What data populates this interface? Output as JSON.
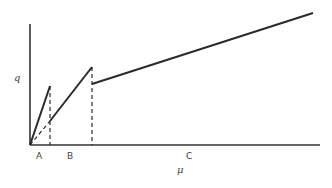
{
  "diagram": {
    "y_axis_label": "q",
    "x_axis_label": "μ",
    "regions": [
      {
        "label": "A"
      },
      {
        "label": "B"
      },
      {
        "label": "C"
      }
    ],
    "colors": {
      "line": "#2a2a2a",
      "background": "#ffffff"
    }
  }
}
